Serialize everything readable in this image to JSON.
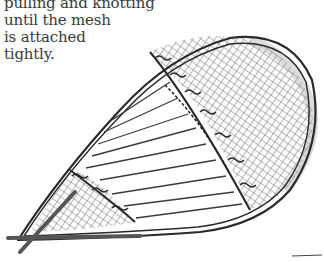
{
  "caption": {
    "lines": [
      "pulling and knotting",
      "until the mesh",
      "is attached",
      "tightly."
    ]
  },
  "illustration": {
    "subject": "snowshoe-frame-with-laced-mesh",
    "style": "pencil-sketch",
    "colors": {
      "ink": "#2a2a2a",
      "mesh": "#6a6a6a",
      "shade": "#9a9a9a",
      "background": "#ffffff"
    }
  }
}
